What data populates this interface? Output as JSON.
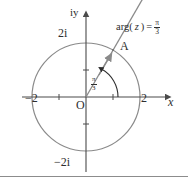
{
  "figure": {
    "type": "argand-diagram",
    "title": "",
    "axes": {
      "x_axis_label": "x",
      "y_axis_label": "iy",
      "origin_label": "O",
      "x_ticks": [
        {
          "value": -2,
          "label": "−2"
        },
        {
          "value": -1,
          "label": ""
        },
        {
          "value": 1,
          "label": ""
        },
        {
          "value": 2,
          "label": "2"
        }
      ],
      "y_ticks": [
        {
          "value": 2,
          "label": "2i"
        },
        {
          "value": 1,
          "label": ""
        },
        {
          "value": -1,
          "label": ""
        },
        {
          "value": -2,
          "label": "−2i"
        }
      ],
      "xlim": [
        -2.6,
        2.9
      ],
      "ylim": [
        -2.6,
        2.7
      ]
    },
    "circle": {
      "center": [
        0,
        0
      ],
      "radius": 2,
      "stroke": "#8a8a8a"
    },
    "ray": {
      "from": [
        0,
        0
      ],
      "angle_radians": "pi/3",
      "angle_degrees": 60,
      "has_arrowhead": true,
      "stroke": "#8a8a8a"
    },
    "point": {
      "label": "A",
      "description": "intersection of ray with circle",
      "coords": [
        1,
        1.732
      ]
    },
    "angle_arc": {
      "label_numerator": "π",
      "label_denominator": "3",
      "has_arrowhead": true,
      "stroke": "#2e2e2e"
    },
    "annotation": {
      "prefix": "arg(",
      "variable": "z",
      "suffix": ")",
      "equals": "=",
      "value_numerator": "π",
      "value_denominator": "3"
    },
    "colors": {
      "curve": "#8a8a8a",
      "axis": "#4a4a4a",
      "text": "#2e2e2e",
      "divider": "#8c8c8c",
      "background": "#ffffff"
    }
  }
}
